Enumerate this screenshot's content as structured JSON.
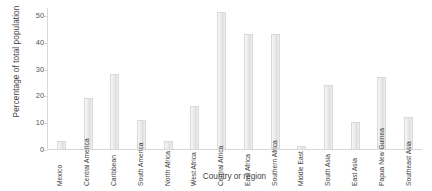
{
  "chart_data": {
    "type": "bar",
    "title": "",
    "xlabel": "Country or region",
    "ylabel": "Percentage of total population",
    "categories": [
      "Mexico",
      "Central America",
      "Caribbean",
      "South America",
      "North Africa",
      "West Africa",
      "Central Africa",
      "East Africa",
      "Southern Africa",
      "Middle East",
      "South Asia",
      "East Asia",
      "Papua New Guinea",
      "Southeast Asia"
    ],
    "values": [
      3,
      19,
      28,
      11,
      3,
      16,
      51,
      43,
      43,
      1,
      24,
      10,
      27,
      12
    ],
    "ylim": [
      0,
      53
    ],
    "yticks": [
      0,
      10,
      20,
      30,
      40,
      50
    ],
    "ytick_labels": [
      "0",
      "10",
      "20",
      "30",
      "40",
      "50"
    ],
    "grid": false,
    "legend": null,
    "bar_color": "#e8e8e8",
    "bar_edge_color": "#d9d9d9",
    "axis_color": "#d8d8d8",
    "text_color": "#3f3f3f"
  }
}
